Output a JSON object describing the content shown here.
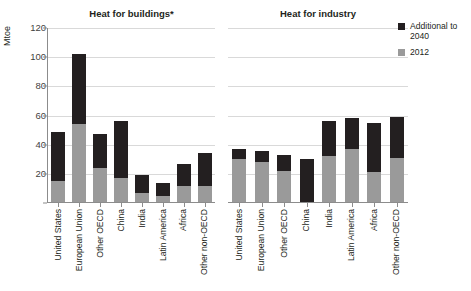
{
  "axis": {
    "y_unit_label": "Mtoe",
    "y_ticks": [
      "0",
      "20",
      "40",
      "60",
      "80",
      "100",
      "120"
    ]
  },
  "legend": {
    "items": [
      {
        "key": "additional",
        "label": "Additional to 2040",
        "color": "#231f20",
        "swatch_name": "legend-swatch-additional"
      },
      {
        "key": "2012",
        "label": "2012",
        "color": "#9a9a9a",
        "swatch_name": "legend-swatch-2012"
      }
    ]
  },
  "panels": [
    {
      "key": "buildings",
      "title": "Heat for buildings*"
    },
    {
      "key": "industry",
      "title": "Heat for industry"
    }
  ],
  "chart_data": [
    {
      "type": "bar",
      "title": "Heat for buildings*",
      "subtitle": "",
      "xlabel": "",
      "ylabel": "Mtoe",
      "ylim": [
        0,
        120
      ],
      "ytick_step": 20,
      "grid": true,
      "stacked": true,
      "legend_position": "right",
      "categories": [
        "United States",
        "European Union",
        "Other OECD",
        "China",
        "India",
        "Latin America",
        "Africa",
        "Other non-OECD"
      ],
      "series": [
        {
          "name": "2012",
          "color": "#9a9a9a",
          "values": [
            15,
            54,
            24,
            17,
            7,
            5,
            12,
            12
          ]
        },
        {
          "name": "Additional to 2040",
          "color": "#231f20",
          "values": [
            34,
            48,
            23,
            39,
            12,
            9,
            15,
            22
          ]
        }
      ],
      "totals": [
        49,
        102,
        47,
        56,
        19,
        14,
        27,
        34
      ]
    },
    {
      "type": "bar",
      "title": "Heat for industry",
      "subtitle": "",
      "xlabel": "",
      "ylabel": "Mtoe",
      "ylim": [
        0,
        120
      ],
      "ytick_step": 20,
      "grid": true,
      "stacked": true,
      "legend_position": "right",
      "categories": [
        "United States",
        "European Union",
        "Other OECD",
        "China",
        "India",
        "Latin America",
        "Africa",
        "Other non-OECD"
      ],
      "series": [
        {
          "name": "2012",
          "color": "#9a9a9a",
          "values": [
            30,
            28,
            22,
            0,
            32,
            37,
            21,
            31
          ]
        },
        {
          "name": "Additional to 2040",
          "color": "#231f20",
          "values": [
            7,
            8,
            11,
            30,
            24,
            21,
            34,
            28
          ]
        }
      ],
      "totals": [
        37,
        36,
        33,
        30,
        56,
        58,
        55,
        59
      ]
    }
  ]
}
